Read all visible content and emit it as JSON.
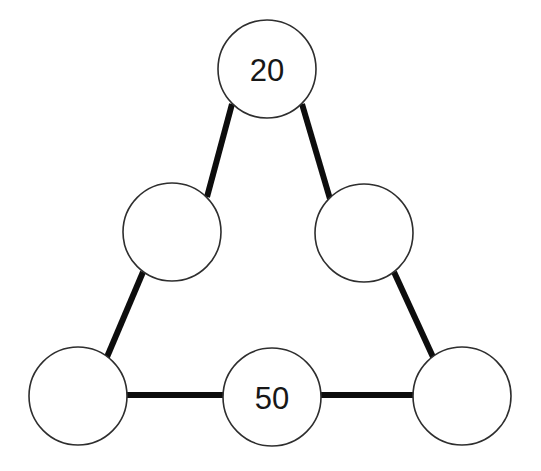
{
  "canvas": {
    "width": 541,
    "height": 471,
    "background_color": "#ffffff"
  },
  "style": {
    "edge_color": "#0d0d0d",
    "edge_width": 6,
    "node_fill": "#ffffff",
    "node_stroke": "#2e2e2e",
    "node_stroke_width": 1.6,
    "label_color": "#171717",
    "label_font_size": 31
  },
  "diagram": {
    "type": "magic-triangle-puzzle",
    "node_radius": 49,
    "nodes": [
      {
        "id": "top",
        "label": "20",
        "filled": true,
        "cx": 267,
        "cy": 69
      },
      {
        "id": "mid-left",
        "label": "",
        "filled": false,
        "cx": 172,
        "cy": 232
      },
      {
        "id": "mid-right",
        "label": "",
        "filled": false,
        "cx": 364,
        "cy": 233
      },
      {
        "id": "bottom-left",
        "label": "",
        "filled": false,
        "cx": 78,
        "cy": 396
      },
      {
        "id": "bottom-middle",
        "label": "50",
        "filled": true,
        "cx": 272,
        "cy": 397
      },
      {
        "id": "bottom-right",
        "label": "",
        "filled": false,
        "cx": 462,
        "cy": 396
      }
    ],
    "edges": [
      {
        "id": "top--mid-left",
        "from": "top",
        "to": "mid-left",
        "x1": 232,
        "y1": 104,
        "x2": 207,
        "y2": 197
      },
      {
        "id": "top--mid-right",
        "from": "top",
        "to": "mid-right",
        "x1": 302,
        "y1": 104,
        "x2": 330,
        "y2": 199
      },
      {
        "id": "mid-left--bottom-left",
        "from": "mid-left",
        "to": "bottom-left",
        "x1": 143,
        "y1": 272,
        "x2": 107,
        "y2": 357
      },
      {
        "id": "mid-right--bottom-right",
        "from": "mid-right",
        "to": "bottom-right",
        "x1": 394,
        "y1": 272,
        "x2": 433,
        "y2": 357
      },
      {
        "id": "bottom-left--bottom-middle",
        "from": "bottom-left",
        "to": "bottom-middle",
        "x1": 126,
        "y1": 395,
        "x2": 224,
        "y2": 395
      },
      {
        "id": "bottom-middle--bottom-right",
        "from": "bottom-middle",
        "to": "bottom-right",
        "x1": 320,
        "y1": 395,
        "x2": 414,
        "y2": 395
      }
    ]
  }
}
